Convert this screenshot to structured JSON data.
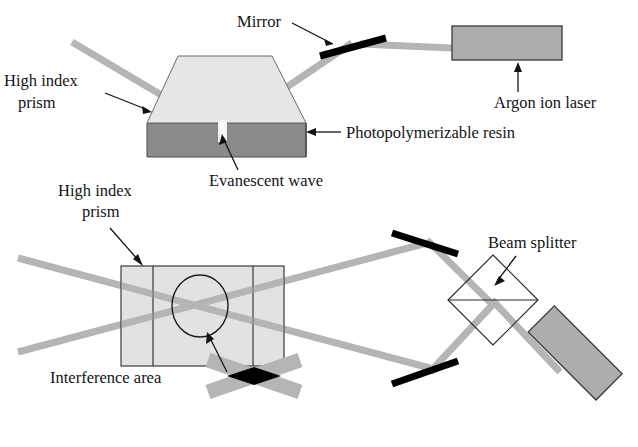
{
  "figure": {
    "panels": [
      {
        "id": "top-panel",
        "name": "Side view: total internal reflection at prism/resin interface"
      },
      {
        "id": "bottom-panel",
        "name": "Top view: two-beam interference through high index prism"
      }
    ]
  },
  "colors": {
    "beam": "#b5b5b5",
    "beam_dark": "#a5a5a5",
    "prism_top": "#e6e6e6",
    "resin": "#8b8b8b",
    "laser_body": "#adadad",
    "mirror": "#000000",
    "stroke": "#3a3a3a",
    "text": "#141414",
    "white": "#ffffff",
    "evanescent": "#f2f2f2"
  },
  "labels": {
    "top": {
      "mirror": "Mirror",
      "argon_ion_laser": "Argon ion laser",
      "high_index_prism_line1": "High index",
      "high_index_prism_line2": "prism",
      "photopolymerizable_resin": "Photopolymerizable resin",
      "evanescent_wave": "Evanescent wave"
    },
    "bottom": {
      "high_index_prism_line1": "High index",
      "high_index_prism_line2": "prism",
      "interference_area": "Interference area",
      "beam_splitter": "Beam splitter"
    }
  },
  "components": {
    "top": [
      {
        "name": "argon-ion-laser",
        "type": "laser-body"
      },
      {
        "name": "mirror",
        "type": "mirror-bar"
      },
      {
        "name": "high-index-prism",
        "type": "trapezoid-prism"
      },
      {
        "name": "photopolymerizable-resin",
        "type": "resin-block"
      },
      {
        "name": "evanescent-wave-spot",
        "type": "interface-spot"
      },
      {
        "name": "incident-beam",
        "type": "beam"
      },
      {
        "name": "reflected-beam",
        "type": "beam"
      },
      {
        "name": "laser-output-beam",
        "type": "beam"
      }
    ],
    "bottom": [
      {
        "name": "argon-ion-laser",
        "type": "laser-body"
      },
      {
        "name": "beam-splitter",
        "type": "diamond-cube"
      },
      {
        "name": "mirror-upper",
        "type": "mirror-bar"
      },
      {
        "name": "mirror-lower",
        "type": "mirror-bar"
      },
      {
        "name": "high-index-prism",
        "type": "rectangular-prism"
      },
      {
        "name": "interference-area-circle",
        "type": "circle-marker"
      },
      {
        "name": "interference-fringe-detail",
        "type": "crossed-beams-detail"
      }
    ]
  }
}
